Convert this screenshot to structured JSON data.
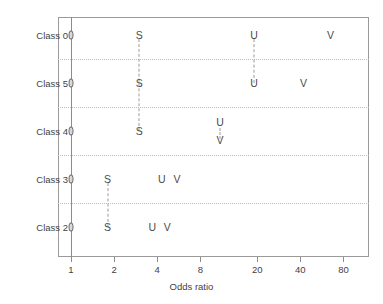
{
  "chart_data": {
    "type": "scatter",
    "title": "",
    "xlabel": "Odds ratio",
    "ylabel": "",
    "scale": "log",
    "grid": true,
    "legend": "none",
    "xlim": [
      0.85,
      100
    ],
    "xticks": [
      1,
      2,
      4,
      8,
      20,
      40,
      80
    ],
    "xtick_labels": [
      "1",
      "2",
      "4",
      "8",
      "20",
      "40",
      "80"
    ],
    "categories": [
      "Class 0",
      "Class 5",
      "Class 4",
      "Class 3",
      "Class 2"
    ],
    "marker_labels": [
      "O",
      "S",
      "U",
      "V"
    ],
    "series": [
      {
        "name": "O",
        "values": [
          1,
          1,
          1,
          1,
          1
        ]
      },
      {
        "name": "S",
        "values": [
          3,
          3,
          3,
          1.8,
          1.8
        ]
      },
      {
        "name": "U",
        "values": [
          19,
          19,
          11,
          4.3,
          3.7
        ]
      },
      {
        "name": "V",
        "values": [
          65,
          42,
          11,
          5.5,
          4.7
        ]
      }
    ],
    "points": [
      {
        "category": "Class 0",
        "label": "O",
        "value": 1
      },
      {
        "category": "Class 0",
        "label": "S",
        "value": 3
      },
      {
        "category": "Class 0",
        "label": "U",
        "value": 19
      },
      {
        "category": "Class 0",
        "label": "V",
        "value": 65
      },
      {
        "category": "Class 5",
        "label": "O",
        "value": 1
      },
      {
        "category": "Class 5",
        "label": "S",
        "value": 3
      },
      {
        "category": "Class 5",
        "label": "U",
        "value": 19
      },
      {
        "category": "Class 5",
        "label": "V",
        "value": 42
      },
      {
        "category": "Class 4",
        "label": "O",
        "value": 1
      },
      {
        "category": "Class 4",
        "label": "S",
        "value": 3
      },
      {
        "category": "Class 4",
        "label": "U",
        "value": 11
      },
      {
        "category": "Class 4",
        "label": "V",
        "value": 11
      },
      {
        "category": "Class 3",
        "label": "O",
        "value": 1
      },
      {
        "category": "Class 3",
        "label": "S",
        "value": 1.8
      },
      {
        "category": "Class 3",
        "label": "U",
        "value": 4.3
      },
      {
        "category": "Class 3",
        "label": "V",
        "value": 5.5
      },
      {
        "category": "Class 2",
        "label": "O",
        "value": 1
      },
      {
        "category": "Class 2",
        "label": "S",
        "value": 1.8
      },
      {
        "category": "Class 2",
        "label": "U",
        "value": 3.7
      },
      {
        "category": "Class 2",
        "label": "V",
        "value": 4.7
      }
    ],
    "reference_line": 1,
    "colors": {
      "axis": "#8c8c8c",
      "frame": "#9a9a9a",
      "grid": "#bdbdbd",
      "marker": "#4a4a4a",
      "connector": "#9a9a9a",
      "background": "#ffffff"
    }
  },
  "axis": {
    "x_title": "Odds ratio",
    "tick_labels": [
      "1",
      "2",
      "4",
      "8",
      "20",
      "40",
      "80"
    ],
    "category_labels": [
      "Class 0",
      "Class 5",
      "Class 4",
      "Class 3",
      "Class 2"
    ]
  }
}
